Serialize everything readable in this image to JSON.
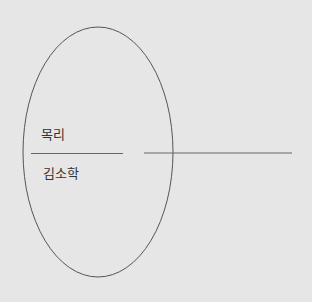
{
  "diagram": {
    "background": "#e6e6e6",
    "stroke_color": "#555555",
    "labels": {
      "top": "목리",
      "bottom": "김소학"
    }
  }
}
